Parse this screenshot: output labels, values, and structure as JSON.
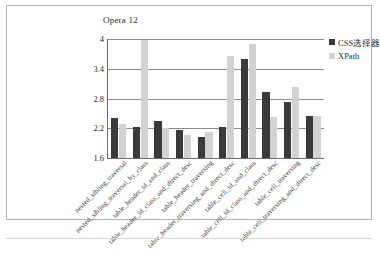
{
  "chart_data": {
    "type": "bar",
    "title": "Opera 12",
    "xlabel": "",
    "ylabel": "",
    "ylim": [
      1.6,
      4.0
    ],
    "yticks": [
      "1.6",
      "2.2",
      "2.8",
      "3.4",
      "4"
    ],
    "grid": true,
    "legend_position": "top-right",
    "categories": [
      "nested_sibling_traversal",
      "nested_sibling_traversal_by_class",
      "table_header_id_and_class",
      "table_header_id_class_and_direct_desc",
      "table_header_traversing",
      "table_header_traversing_and_direct_desc",
      "table_cell_id_and_class",
      "table_cell_id_class_and_direct_desc",
      "table_cell_traversing",
      "table_cell_traversing_and_direct_desc"
    ],
    "series": [
      {
        "name": "CSS选择器",
        "color": "#3a3a3a",
        "values": [
          2.4,
          2.22,
          2.35,
          2.16,
          2.02,
          2.22,
          3.6,
          2.94,
          2.72,
          2.45
        ]
      },
      {
        "name": "XPath",
        "color": "#d2d2d2",
        "values": [
          2.29,
          3.98,
          2.2,
          2.07,
          2.13,
          3.65,
          3.9,
          2.43,
          3.04,
          2.45
        ]
      }
    ]
  }
}
